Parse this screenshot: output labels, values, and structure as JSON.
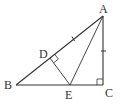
{
  "diagram": {
    "type": "geometry",
    "points": {
      "A": {
        "label": "A",
        "x": 103,
        "y": 16
      },
      "B": {
        "label": "B",
        "x": 16,
        "y": 85
      },
      "C": {
        "label": "C",
        "x": 103,
        "y": 85
      },
      "D": {
        "label": "D",
        "x": 50,
        "y": 58
      },
      "E": {
        "label": "E",
        "x": 70,
        "y": 85
      }
    },
    "segments": [
      "AB",
      "BC",
      "CA",
      "AE",
      "DE"
    ],
    "right_angles": [
      "C",
      "D"
    ],
    "equal_marks": [
      "AD",
      "AC"
    ],
    "stroke_color": "#333333"
  }
}
